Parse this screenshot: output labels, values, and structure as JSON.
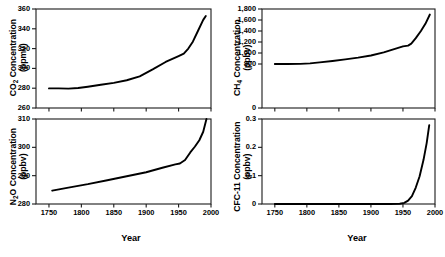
{
  "figure": {
    "background": "#ffffff",
    "line_color": "#000000",
    "axis_color": "#1a1a1a"
  },
  "axis_titles": {
    "x": "Year"
  },
  "chart_data": [
    {
      "id": "co2",
      "type": "line",
      "title": "",
      "ylabel_main": "CO",
      "ylabel_sub": "2",
      "ylabel_rest": " Concentration",
      "ylabel_units": "(ppmv)",
      "xlabel": "Year",
      "ylabel": "CO2 Concentration (ppmv)",
      "xlim": [
        1730,
        2000
      ],
      "ylim": [
        260,
        360
      ],
      "xticks": [
        1750,
        1800,
        1850,
        1900,
        1950,
        2000
      ],
      "xticklabels": [],
      "yticks": [
        260,
        280,
        300,
        320,
        340,
        360
      ],
      "yticklabels": [
        "260",
        "280",
        "300",
        "320",
        "340",
        "360"
      ],
      "grid": false,
      "legend": "none",
      "x": [
        1750,
        1765,
        1780,
        1795,
        1810,
        1830,
        1850,
        1870,
        1890,
        1910,
        1930,
        1950,
        1958,
        1965,
        1972,
        1980,
        1988,
        1992
      ],
      "values": [
        279.8,
        279.8,
        279.6,
        280.2,
        281.5,
        283.5,
        285.4,
        288.0,
        292.0,
        299.0,
        306.5,
        312.5,
        315.0,
        320.0,
        327.0,
        338.0,
        349.0,
        353.0
      ]
    },
    {
      "id": "ch4",
      "type": "line",
      "title": "",
      "ylabel_main": "CH",
      "ylabel_sub": "4",
      "ylabel_rest": " Concentration",
      "ylabel_units": "(ppbv)",
      "xlabel": "Year",
      "ylabel": "CH4 Concentration (ppbv)",
      "xlim": [
        1730,
        2000
      ],
      "ylim": [
        0,
        1800
      ],
      "xticks": [
        1750,
        1800,
        1850,
        1900,
        1950,
        2000
      ],
      "xticklabels": [],
      "yticks": [
        0,
        800,
        1000,
        1200,
        1400,
        1600,
        1800
      ],
      "yticklabels": [
        "0",
        "800",
        "1,000",
        "1,200",
        "1,400",
        "1,600",
        "1,800"
      ],
      "grid": false,
      "legend": "none",
      "x": [
        1750,
        1770,
        1790,
        1805,
        1820,
        1840,
        1860,
        1880,
        1900,
        1920,
        1940,
        1950,
        1958,
        1963,
        1970,
        1978,
        1985,
        1992
      ],
      "values": [
        800,
        800,
        802,
        812,
        830,
        855,
        885,
        915,
        955,
        1010,
        1085,
        1120,
        1135,
        1170,
        1270,
        1400,
        1530,
        1700
      ]
    },
    {
      "id": "n2o",
      "type": "line",
      "title": "",
      "ylabel_main": "N",
      "ylabel_sub": "2",
      "ylabel_rest": "O Concentration",
      "ylabel_units": "(ppbv)",
      "xlabel": "Year",
      "ylabel": "N2O Concentration (ppbv)",
      "xlim": [
        1730,
        2000
      ],
      "ylim": [
        280,
        310
      ],
      "xticks": [
        1750,
        1800,
        1850,
        1900,
        1950,
        2000
      ],
      "xticklabels": [
        "1750",
        "1800",
        "1850",
        "1900",
        "1950",
        "2000"
      ],
      "yticks": [
        280,
        290,
        300,
        310
      ],
      "yticklabels": [
        "280",
        "290",
        "300",
        "310"
      ],
      "grid": false,
      "legend": "none",
      "x": [
        1755,
        1780,
        1810,
        1840,
        1870,
        1900,
        1925,
        1945,
        1952,
        1960,
        1968,
        1975,
        1982,
        1988,
        1993
      ],
      "values": [
        284.7,
        285.8,
        287.0,
        288.4,
        289.8,
        291.2,
        292.8,
        294.0,
        294.3,
        295.5,
        298.2,
        300.2,
        302.5,
        305.5,
        310.0
      ]
    },
    {
      "id": "cfc11",
      "type": "line",
      "title": "",
      "ylabel_main": "CFC-11 Concentration",
      "ylabel_sub": "",
      "ylabel_rest": "",
      "ylabel_units": "(ppbv)",
      "xlabel": "Year",
      "ylabel": "CFC-11 Concentration (ppbv)",
      "xlim": [
        1730,
        2000
      ],
      "ylim": [
        0,
        0.3
      ],
      "xticks": [
        1750,
        1800,
        1850,
        1900,
        1950,
        2000
      ],
      "xticklabels": [
        "1750",
        "1800",
        "1850",
        "1900",
        "1950",
        "2000"
      ],
      "yticks": [
        0,
        0.1,
        0.2,
        0.3
      ],
      "yticklabels": [
        "0",
        "0.1",
        "0.2",
        "0.3"
      ],
      "grid": false,
      "legend": "none",
      "x": [
        1750,
        1850,
        1900,
        1930,
        1945,
        1952,
        1958,
        1964,
        1970,
        1976,
        1982,
        1987,
        1991
      ],
      "values": [
        0,
        0,
        0,
        0,
        0.001,
        0.004,
        0.012,
        0.028,
        0.058,
        0.098,
        0.155,
        0.215,
        0.278
      ]
    }
  ]
}
